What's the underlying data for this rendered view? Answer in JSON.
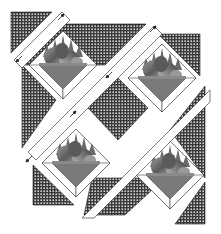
{
  "diagram": {
    "type": "quilt-assembly-diagram",
    "background": "#ffffff",
    "colors": {
      "check_dark": "#3a3a3a",
      "check_light": "#d8d8d8",
      "sashing": "#ffffff",
      "outline": "#222222",
      "basket": "#7a7a7a",
      "basket_dark": "#5a5a5a",
      "points_dark": "#6a6a6a",
      "fruit_light": "#a8a8a8",
      "fruit_dark": "#4a4a4a",
      "arrow": "#222222"
    },
    "blocks": [
      {
        "id": "basket-top-left",
        "cx": 63,
        "cy": 65
      },
      {
        "id": "basket-top-right",
        "cx": 162,
        "cy": 78
      },
      {
        "id": "basket-bottom-left",
        "cx": 76,
        "cy": 163
      },
      {
        "id": "basket-bottom-right",
        "cx": 170,
        "cy": 175
      }
    ],
    "arrows": [
      {
        "id": "arrow-1",
        "x": 60,
        "y": 18
      },
      {
        "id": "arrow-2",
        "x": 20,
        "y": 58
      },
      {
        "id": "arrow-3",
        "x": 153,
        "y": 30
      },
      {
        "id": "arrow-4",
        "x": 110,
        "y": 74
      },
      {
        "id": "arrow-5",
        "x": 72,
        "y": 115
      },
      {
        "id": "arrow-6",
        "x": 30,
        "y": 158
      }
    ]
  }
}
